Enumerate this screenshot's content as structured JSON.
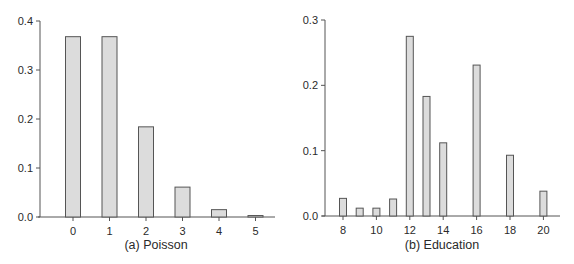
{
  "chart_data": [
    {
      "type": "bar",
      "title": "(a) Poisson",
      "xlabel": "",
      "ylabel": "",
      "categories": [
        "0",
        "1",
        "2",
        "3",
        "4",
        "5"
      ],
      "x": [
        0,
        1,
        2,
        3,
        4,
        5
      ],
      "values": [
        0.368,
        0.368,
        0.184,
        0.061,
        0.015,
        0.003
      ],
      "ylim": [
        0,
        0.4
      ],
      "yticks": [
        0.0,
        0.1,
        0.2,
        0.3,
        0.4
      ],
      "ytick_labels": [
        "0.0",
        "0.1",
        "0.2",
        "0.3",
        "0.4"
      ],
      "xticks": [
        0,
        1,
        2,
        3,
        4,
        5
      ],
      "xtick_labels": [
        "0",
        "1",
        "2",
        "3",
        "4",
        "5"
      ],
      "grid": false,
      "legend": null
    },
    {
      "type": "bar",
      "title": "(b) Education",
      "xlabel": "",
      "ylabel": "",
      "categories": [
        "8",
        "9",
        "10",
        "11",
        "12",
        "13",
        "14",
        "16",
        "18",
        "20"
      ],
      "x": [
        8,
        9,
        10,
        11,
        12,
        13,
        14,
        16,
        18,
        20
      ],
      "values": [
        0.027,
        0.012,
        0.012,
        0.026,
        0.275,
        0.183,
        0.112,
        0.231,
        0.093,
        0.038
      ],
      "ylim": [
        0,
        0.3
      ],
      "yticks": [
        0.0,
        0.1,
        0.2,
        0.3
      ],
      "ytick_labels": [
        "0.0",
        "0.1",
        "0.2",
        "0.3"
      ],
      "xticks": [
        8,
        10,
        12,
        14,
        16,
        18,
        20
      ],
      "xtick_labels": [
        "8",
        "10",
        "12",
        "14",
        "16",
        "18",
        "20"
      ],
      "grid": false,
      "legend": null
    }
  ],
  "colors": {
    "bar_fill": "#dcdcdc",
    "bar_stroke": "#555555",
    "axis": "#555555",
    "text": "#2a2a2a"
  }
}
